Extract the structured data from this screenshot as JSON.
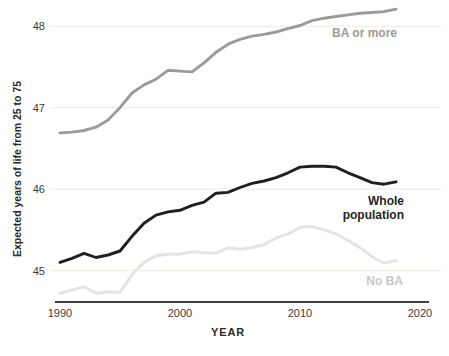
{
  "chart_data": {
    "type": "line",
    "title": "",
    "xlabel": "YEAR",
    "ylabel": "Expected years of life from 25 to 75",
    "x_ticks": [
      1990,
      2000,
      2010,
      2020
    ],
    "y_ticks": [
      45,
      46,
      47,
      48
    ],
    "xlim": [
      1990,
      2020
    ],
    "ylim": [
      44.6,
      48.35
    ],
    "grid": "horizontal-only",
    "legend_position": "inline-right-of-lines",
    "x": [
      1990,
      1991,
      1992,
      1993,
      1994,
      1995,
      1996,
      1997,
      1998,
      1999,
      2000,
      2001,
      2002,
      2003,
      2004,
      2005,
      2006,
      2007,
      2008,
      2009,
      2010,
      2011,
      2012,
      2013,
      2014,
      2015,
      2016,
      2017,
      2018
    ],
    "series": [
      {
        "name": "BA or more",
        "label_lines": [
          "BA or more"
        ],
        "color": "#9b9b9b",
        "label_color": "#9b9b9b",
        "values": [
          46.69,
          46.7,
          46.72,
          46.76,
          46.85,
          47.0,
          47.18,
          47.28,
          47.35,
          47.46,
          47.45,
          47.44,
          47.55,
          47.68,
          47.78,
          47.84,
          47.88,
          47.9,
          47.93,
          47.97,
          48.01,
          48.07,
          48.1,
          48.12,
          48.14,
          48.16,
          48.17,
          48.18,
          48.21
        ]
      },
      {
        "name": "Whole population",
        "label_lines": [
          "Whole",
          "population"
        ],
        "color": "#1f1f1f",
        "label_color": "#262626",
        "values": [
          45.1,
          45.15,
          45.21,
          45.16,
          45.19,
          45.24,
          45.42,
          45.58,
          45.68,
          45.72,
          45.74,
          45.8,
          45.84,
          45.95,
          45.96,
          46.02,
          46.07,
          46.1,
          46.14,
          46.2,
          46.27,
          46.28,
          46.28,
          46.27,
          46.2,
          46.14,
          46.08,
          46.06,
          46.09
        ]
      },
      {
        "name": "No BA",
        "label_lines": [
          "No BA"
        ],
        "color": "#e4e4e1",
        "label_color": "#c8c8c5",
        "values": [
          44.72,
          44.76,
          44.8,
          44.72,
          44.74,
          44.73,
          44.95,
          45.1,
          45.18,
          45.2,
          45.2,
          45.23,
          45.22,
          45.21,
          45.28,
          45.26,
          45.28,
          45.32,
          45.4,
          45.45,
          45.53,
          45.54,
          45.5,
          45.45,
          45.37,
          45.28,
          45.17,
          45.09,
          45.12
        ]
      }
    ]
  },
  "colors": {
    "background": "#ffffff",
    "gridline": "#f1ede7",
    "axis_line": "#3f3f3f",
    "tick_text": "#3a3a3a"
  }
}
